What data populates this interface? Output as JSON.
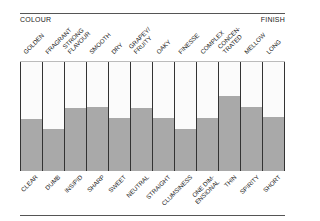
{
  "header": {
    "left": "COLOUR",
    "right": "FINISH"
  },
  "chart_data": {
    "type": "bar",
    "title": "",
    "xlabel": "",
    "ylabel": "",
    "ylim": [
      0,
      1
    ],
    "grid": false,
    "categories_top": [
      "GOLDEN",
      "FRAGRANT",
      "STRONG\nFLAVOUR",
      "SMOOTH",
      "DRY",
      "GRAPEY/\nFRUITY",
      "OAKY",
      "FINESSE",
      "COMPLEX",
      "CONCEN-\nTRATED",
      "MELLOW",
      "LONG"
    ],
    "categories_bottom": [
      "CLEAR",
      "DUMB",
      "INSIPID",
      "SHARP",
      "SWEET",
      "NEUTRAL",
      "STRAIGHT",
      "CLUMSINESS",
      "ONE DIM-\nENSIONAL",
      "THIN",
      "SPIRITY",
      "SHORT"
    ],
    "values": [
      0.48,
      0.39,
      0.58,
      0.59,
      0.49,
      0.58,
      0.49,
      0.39,
      0.49,
      0.69,
      0.59,
      0.5
    ],
    "fill_color": "#a9a9a9",
    "empty_color": "#fbfbfb"
  }
}
